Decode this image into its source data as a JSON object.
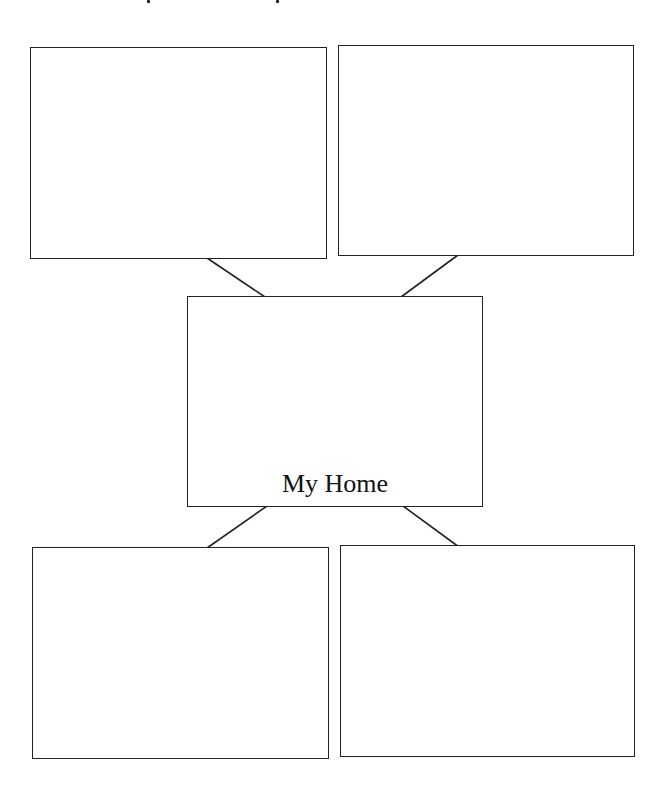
{
  "diagram": {
    "type": "web organizer",
    "center": {
      "label": "My Home"
    },
    "satellites": [
      {
        "position": "top-left",
        "label": ""
      },
      {
        "position": "top-right",
        "label": ""
      },
      {
        "position": "bottom-left",
        "label": ""
      },
      {
        "position": "bottom-right",
        "label": ""
      }
    ],
    "colors": {
      "line": "#222222",
      "background": "#ffffff",
      "text": "#111111"
    }
  }
}
